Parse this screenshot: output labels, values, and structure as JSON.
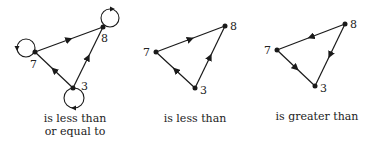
{
  "diagrams": [
    {
      "caption_line1": "is less than",
      "caption_line2": "or equal to",
      "nodes": [
        {
          "label": "7",
          "x": 35,
          "y": 52
        },
        {
          "label": "8",
          "x": 103,
          "y": 27
        },
        {
          "label": "3",
          "x": 73,
          "y": 88
        }
      ],
      "edges": [
        [
          "7",
          "8"
        ],
        [
          "3",
          "7"
        ],
        [
          "3",
          "8"
        ]
      ],
      "self_loops": [
        "7",
        "8",
        "3"
      ]
    },
    {
      "caption_line1": "is less than",
      "nodes": [
        {
          "label": "7",
          "x": 156,
          "y": 52
        },
        {
          "label": "8",
          "x": 225,
          "y": 26
        },
        {
          "label": "3",
          "x": 195,
          "y": 88
        }
      ],
      "edges": [
        [
          "7",
          "8"
        ],
        [
          "3",
          "7"
        ],
        [
          "3",
          "8"
        ]
      ],
      "self_loops": []
    },
    {
      "caption_line1": "is greater than",
      "nodes": [
        {
          "label": "7",
          "x": 277,
          "y": 50
        },
        {
          "label": "8",
          "x": 345,
          "y": 24
        },
        {
          "label": "3",
          "x": 315,
          "y": 86
        }
      ],
      "edges": [
        [
          "8",
          "7"
        ],
        [
          "7",
          "3"
        ],
        [
          "8",
          "3"
        ]
      ],
      "self_loops": []
    }
  ],
  "colors": {
    "stroke": "#1a1a1a",
    "text": "#222222"
  }
}
